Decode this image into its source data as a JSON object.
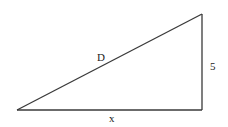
{
  "diagram": {
    "type": "right-triangle",
    "vertices": {
      "bottom_left": [
        17,
        110
      ],
      "bottom_right": [
        202,
        110
      ],
      "top_right": [
        202,
        14
      ]
    },
    "labels": {
      "hypotenuse": "D",
      "vertical_side": "5",
      "horizontal_side": "x"
    },
    "colors": {
      "line": "#3a3a3a",
      "text": "#222222",
      "background": "#ffffff"
    }
  }
}
